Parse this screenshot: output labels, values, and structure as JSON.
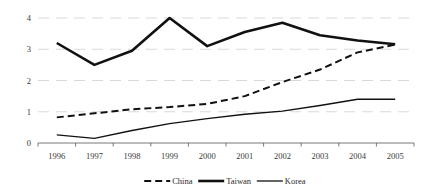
{
  "chart_data": {
    "type": "line",
    "title": "",
    "subtitle": "",
    "xlabel": "",
    "ylabel": "",
    "categories": [
      "1996",
      "1997",
      "1998",
      "1999",
      "2000",
      "2001",
      "2002",
      "2003",
      "2004",
      "2005"
    ],
    "x": [
      1996,
      1997,
      1998,
      1999,
      2000,
      2001,
      2002,
      2003,
      2004,
      2005
    ],
    "series": [
      {
        "name": "China",
        "style": "dashed",
        "color": "#111111",
        "width": 2.0,
        "values": [
          0.82,
          0.95,
          1.08,
          1.15,
          1.25,
          1.5,
          1.95,
          2.35,
          2.9,
          3.15
        ]
      },
      {
        "name": "Taiwan",
        "style": "solid",
        "color": "#111111",
        "width": 2.6,
        "values": [
          3.2,
          2.5,
          2.95,
          4.0,
          3.1,
          3.55,
          3.85,
          3.45,
          3.28,
          3.16
        ]
      },
      {
        "name": "Korea",
        "style": "solid",
        "color": "#111111",
        "width": 1.3,
        "values": [
          0.26,
          0.15,
          0.4,
          0.62,
          0.78,
          0.92,
          1.02,
          1.2,
          1.4,
          1.4
        ]
      }
    ],
    "ylim": [
      0,
      4.3
    ],
    "yticks": [
      0,
      1,
      2,
      3,
      4
    ],
    "ytick_labels": [
      "0",
      "1",
      "2",
      "3",
      "4"
    ],
    "grid": true,
    "grid_color": "#c8c8c8",
    "axis_color": "#555555",
    "legend_position": "bottom",
    "legend_entries": [
      "China",
      "Taiwan",
      "Korea"
    ]
  }
}
